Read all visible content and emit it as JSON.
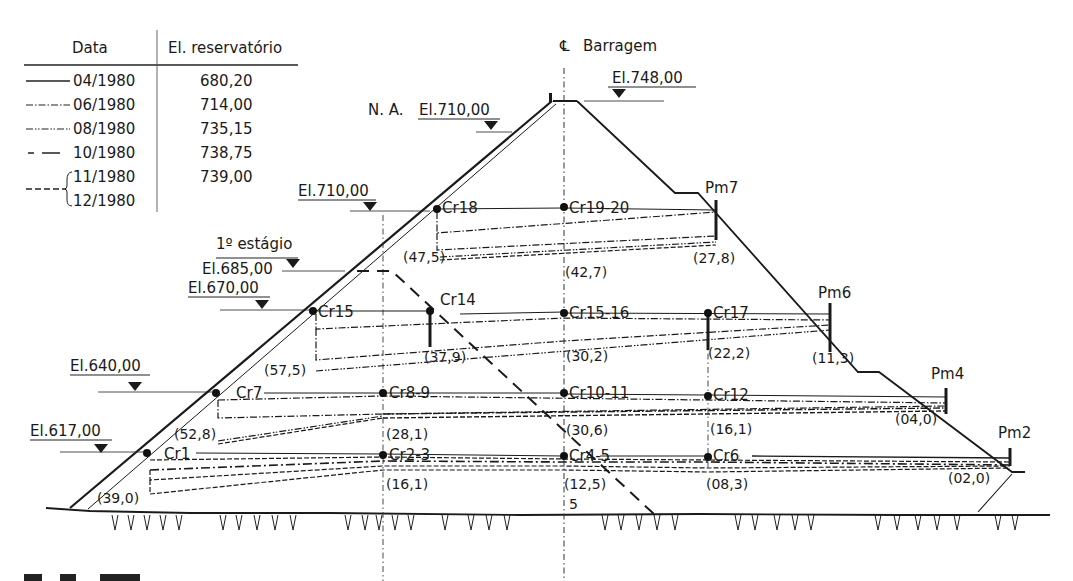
{
  "legend": {
    "header_date": "Data",
    "header_elevation": "El. reservatório",
    "rows": [
      {
        "date": "04/1980",
        "elevation": "680,20",
        "line": "solid"
      },
      {
        "date": "06/1980",
        "elevation": "714,00",
        "line": "dash-dot"
      },
      {
        "date": "08/1980",
        "elevation": "735,15",
        "line": "dash-dot-dot"
      },
      {
        "date": "10/1980",
        "elevation": "738,75",
        "line": "long-dash"
      },
      {
        "date": "11/1980",
        "elevation": "739,00",
        "line": "short-dash"
      },
      {
        "date": "12/1980",
        "elevation": "",
        "line": "short-dash"
      }
    ]
  },
  "centerline": {
    "symbol": "℄",
    "label": "Barragem"
  },
  "elevations": {
    "crest": "El.748,00",
    "na_prefix": "N. A.",
    "na": "El.710,00",
    "el710": "El.710,00",
    "stage_label": "1º estágio",
    "el685": "El.685,00",
    "el670": "El.670,00",
    "el640": "El.640,00",
    "el617": "El.617,00"
  },
  "instruments": {
    "cr18": "Cr18",
    "cr19_20": "Cr19-20",
    "pm7": "Pm7",
    "cr15": "Cr15",
    "cr14": "Cr14",
    "cr15_16": "Cr15-16",
    "cr17": "Cr17",
    "pm6": "Pm6",
    "cr7": "Cr7",
    "cr8_9": "Cr8-9",
    "cr10_11": "Cr10-11",
    "cr12": "Cr12",
    "pm4": "Pm4",
    "cr1": "Cr1",
    "cr2_3": "Cr2-3",
    "cr4_5": "Cr4-5",
    "cr6": "Cr6",
    "pm2": "Pm2"
  },
  "settlements": {
    "s47_5": "(47,5)",
    "s42_7": "(42,7)",
    "s27_8": "(27,8)",
    "s57_5": "(57,5)",
    "s37_9": "(37,9)",
    "s30_2": "(30,2)",
    "s22_2": "(22,2)",
    "s11_3": "(11,3)",
    "s52_8": "(52,8)",
    "s28_1": "(28,1)",
    "s30_6": "(30,6)",
    "s16_1a": "(16,1)",
    "s04_0": "(04,0)",
    "s39_0": "(39,0)",
    "s16_1b": "(16,1)",
    "s12_5": "(12,5)",
    "s08_3": "(08,3)",
    "s02_0": "(02,0)"
  },
  "misc": {
    "foundation_mark": "5"
  }
}
